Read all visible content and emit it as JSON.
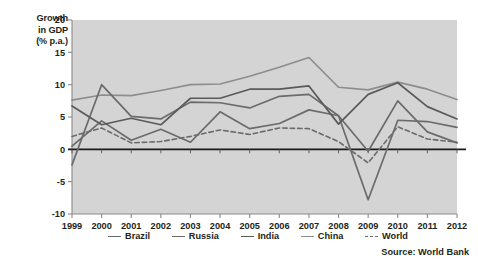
{
  "axis": {
    "y_title_lines": [
      "Growth",
      "in GDP",
      "(% p.a.)"
    ],
    "y_ticks": [
      "20",
      "15",
      "10",
      "5",
      "0",
      "-5",
      "-10"
    ],
    "x_ticks": [
      "1999",
      "2000",
      "2001",
      "2002",
      "2003",
      "2004",
      "2005",
      "2006",
      "2007",
      "2008",
      "2009",
      "2010",
      "2011",
      "2012"
    ]
  },
  "legend": {
    "items": [
      {
        "label": "Brazil",
        "color": "#6b6b6b",
        "style": "solid"
      },
      {
        "label": "Russia",
        "color": "#6b6b6b",
        "style": "solid"
      },
      {
        "label": "India",
        "color": "#5a5a5a",
        "style": "solid"
      },
      {
        "label": "China",
        "color": "#8d8d8d",
        "style": "solid"
      },
      {
        "label": "World",
        "color": "#6b6b6b",
        "style": "dashed"
      }
    ]
  },
  "source": {
    "text": "Source: World Bank"
  },
  "colors": {
    "plot_background": "#d4d4d4",
    "plot_border": "#8a8a8a",
    "zero_line": "#1a1a1a",
    "brazil": "#6b6b6b",
    "russia": "#6b6b6b",
    "india": "#5a5a5a",
    "china": "#8d8d8d",
    "world": "#6b6b6b"
  },
  "chart_data": {
    "type": "line",
    "title": "",
    "xlabel": "",
    "ylabel": "Growth in GDP (% p.a.)",
    "ylim": [
      -10,
      20
    ],
    "ytick_step": 5,
    "grid": false,
    "legend_position": "bottom",
    "x": [
      1999,
      2000,
      2001,
      2002,
      2003,
      2004,
      2005,
      2006,
      2007,
      2008,
      2009,
      2010,
      2011,
      2012
    ],
    "categories": [
      "1999",
      "2000",
      "2001",
      "2002",
      "2003",
      "2004",
      "2005",
      "2006",
      "2007",
      "2008",
      "2009",
      "2010",
      "2011",
      "2012"
    ],
    "series": [
      {
        "name": "Brazil",
        "color": "#6b6b6b",
        "style": "solid",
        "values": [
          0.5,
          4.4,
          1.4,
          3.1,
          1.1,
          5.8,
          3.2,
          4.0,
          6.1,
          5.2,
          -0.3,
          7.5,
          2.7,
          1.0
        ]
      },
      {
        "name": "Russia",
        "color": "#6b6b6b",
        "style": "solid",
        "values": [
          -2.4,
          10.0,
          5.1,
          4.7,
          7.3,
          7.2,
          6.4,
          8.2,
          8.5,
          5.2,
          -7.8,
          4.5,
          4.3,
          3.4
        ]
      },
      {
        "name": "India",
        "color": "#5a5a5a",
        "style": "solid",
        "values": [
          6.7,
          3.8,
          4.8,
          3.8,
          7.9,
          7.9,
          9.3,
          9.3,
          9.8,
          3.9,
          8.5,
          10.3,
          6.6,
          4.7
        ]
      },
      {
        "name": "China",
        "color": "#8d8d8d",
        "style": "solid",
        "values": [
          7.6,
          8.4,
          8.3,
          9.1,
          10.0,
          10.1,
          11.3,
          12.7,
          14.2,
          9.6,
          9.2,
          10.4,
          9.3,
          7.7
        ]
      },
      {
        "name": "World",
        "color": "#6b6b6b",
        "style": "dashed",
        "values": [
          2.0,
          3.3,
          1.0,
          1.2,
          2.0,
          3.0,
          2.3,
          3.3,
          3.2,
          1.2,
          -2.1,
          3.5,
          1.6,
          1.1
        ]
      }
    ]
  }
}
